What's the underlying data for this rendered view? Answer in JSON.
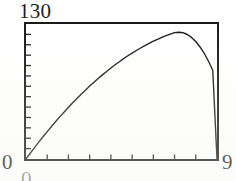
{
  "screen": {
    "name": "graphing-calculator-plot-window",
    "background_color": "#ffffff",
    "frame_color": "#101010",
    "curve_color": "#101010"
  },
  "labels": {
    "y_max": "130",
    "y_min": "0",
    "x_max": "9",
    "x_min": "0"
  },
  "chart_data": {
    "type": "line",
    "title": "",
    "subtitle": "",
    "xlabel": "",
    "ylabel": "",
    "xlim": [
      0,
      9
    ],
    "ylim": [
      0,
      130
    ],
    "grid": false,
    "legend": null,
    "legend_position": "none",
    "axis_style": "boxed-frame-with-ticks",
    "x_tick_count": 9,
    "x_tick_step": 1,
    "x_ticks": [
      1,
      2,
      3,
      4,
      5,
      6,
      7,
      8,
      9
    ],
    "y_tick_count": 13,
    "y_tick_step": 10,
    "y_ticks": [
      10,
      20,
      30,
      40,
      50,
      60,
      70,
      80,
      90,
      100,
      110,
      120,
      130
    ],
    "tick_side": "inside",
    "curve_shape": "downward-parabola",
    "peak": {
      "x": 4.4,
      "y": 122
    },
    "x_intercepts": [
      0.15,
      8.8
    ],
    "x": [
      0.0,
      0.2,
      0.4,
      0.6,
      0.8,
      1.0,
      1.2,
      1.4,
      1.6,
      1.8,
      2.0,
      2.2,
      2.4,
      2.6,
      2.8,
      3.0,
      3.2,
      3.4,
      3.6,
      3.8,
      4.0,
      4.2,
      4.4,
      4.6,
      4.8,
      5.0,
      5.2,
      5.4,
      5.6,
      5.8,
      6.0,
      6.2,
      6.4,
      6.6,
      6.8,
      7.0,
      7.2,
      7.4,
      7.6,
      7.8,
      8.0,
      8.2,
      8.4,
      8.6,
      8.8,
      9.0
    ],
    "values": [
      0.0,
      5.5,
      11.0,
      16.2,
      21.4,
      26.4,
      31.3,
      36.1,
      40.8,
      45.3,
      49.8,
      54.1,
      58.3,
      62.4,
      66.3,
      70.2,
      73.9,
      77.5,
      81.0,
      84.3,
      87.6,
      90.7,
      93.7,
      96.6,
      99.4,
      102.0,
      104.5,
      106.9,
      109.2,
      111.4,
      113.4,
      115.3,
      117.1,
      118.8,
      120.3,
      121.7,
      122.1,
      121.6,
      119.9,
      117.1,
      113.1,
      107.9,
      101.6,
      94.1,
      85.5,
      0.0
    ],
    "series": [
      {
        "name": "trajectory",
        "color": "#101010",
        "style": "solid-thin-aliased"
      }
    ]
  }
}
